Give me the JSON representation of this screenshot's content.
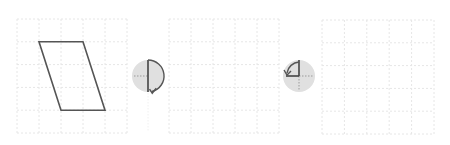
{
  "diagram": {
    "type": "rotation-sequence",
    "grid": {
      "cols": 5,
      "rows": 5,
      "line_color": "#e6e6e6",
      "dash": "2,2"
    },
    "panels": [
      {
        "id": "start",
        "x": 17,
        "y": 19,
        "w": 110,
        "h": 114,
        "shape": "parallelogram",
        "vertices_grid": [
          [
            1,
            1
          ],
          [
            3,
            1
          ],
          [
            4,
            4
          ],
          [
            2,
            4
          ]
        ]
      },
      {
        "id": "middle",
        "x": 169,
        "y": 19,
        "w": 110,
        "h": 114,
        "shape": null
      },
      {
        "id": "end",
        "x": 322,
        "y": 20,
        "w": 112,
        "h": 114,
        "shape": null
      }
    ],
    "operations": [
      {
        "id": "rotate-1",
        "icon": "rotate-180-clockwise-icon",
        "cx": 148,
        "cy": 76,
        "r": 16,
        "direction": "clockwise",
        "angle": 180
      },
      {
        "id": "rotate-2",
        "icon": "rotate-90-counterclockwise-icon",
        "cx": 299,
        "cy": 76,
        "r": 16,
        "direction": "counterclockwise",
        "angle": 90
      }
    ],
    "colors": {
      "shape_stroke": "#555555",
      "icon_fill": "#e0e0e0",
      "icon_stroke": "#555555",
      "icon_dotted": "#999999"
    }
  }
}
